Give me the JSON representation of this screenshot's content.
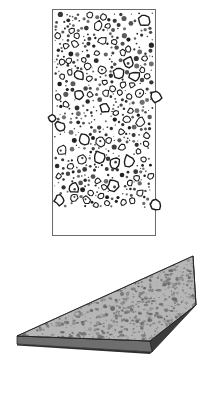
{
  "figure": {
    "background_color": "#ffffff",
    "panels": [
      {
        "id": "micrograph",
        "name": "particle-distribution-micrograph",
        "shape": "rectangle",
        "frame": {
          "x": 52,
          "y": 9,
          "width": 104,
          "height": 227
        },
        "frame_stroke_color": "#6b6b6b",
        "fill_color": "#ffffff",
        "particle_color": "#1a1a1a",
        "particle_region": {
          "x": 54,
          "y": 11,
          "width": 100,
          "height": 197
        },
        "blank_band": {
          "x": 54,
          "y": 208,
          "width": 100,
          "height": 26
        },
        "edge_particles": [
          {
            "side": "right",
            "x": 156,
            "y": 97,
            "r": 5.5
          },
          {
            "side": "left",
            "x": 52,
            "y": 118,
            "r": 3.5
          },
          {
            "side": "right",
            "x": 156,
            "y": 205,
            "r": 5.0
          }
        ]
      },
      {
        "id": "wedge",
        "name": "tapered-wedge-specimen",
        "shape": "wedge",
        "top_face_color": "#b2b2b2",
        "top_face_speckle_color": "#595959",
        "side_face_color": "#3c3c3c",
        "front_edge_color": "#6e6e6e",
        "bottom_edge_color": "#2e2e2e",
        "outline_color": "#1e1e1e",
        "vertices": {
          "tip_left": {
            "x": 17,
            "y": 336
          },
          "apex_top": {
            "x": 193,
            "y": 256
          },
          "back_right": {
            "x": 196,
            "y": 305
          },
          "front_bottom": {
            "x": 150,
            "y": 341
          },
          "tip_left_lower": {
            "x": 17,
            "y": 344
          },
          "front_bottom_lower": {
            "x": 152,
            "y": 352
          }
        }
      }
    ]
  },
  "labels": {
    "panel_a": "",
    "panel_b": "",
    "caption": ""
  }
}
